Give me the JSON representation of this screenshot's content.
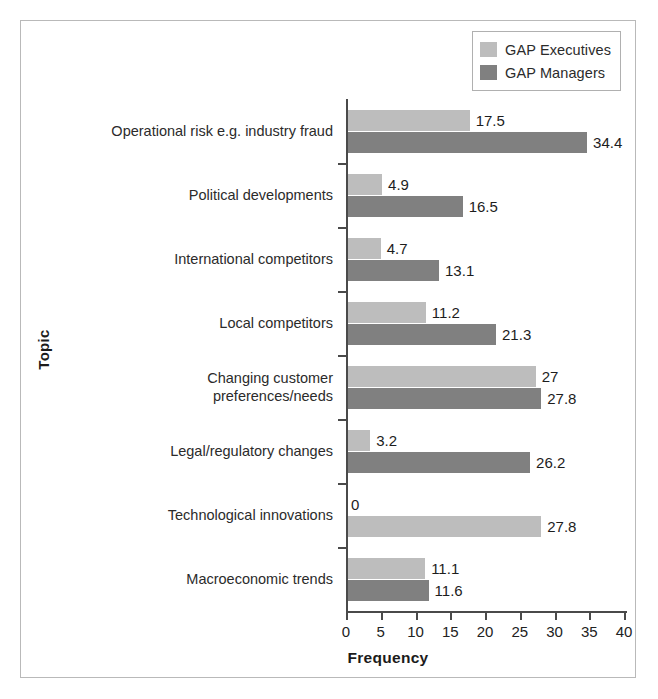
{
  "legend": {
    "position": "top-right",
    "entries": [
      {
        "label": "GAP Executives",
        "color": "#bdbdbd",
        "swatch_name": "legend-swatch-executives"
      },
      {
        "label": "GAP Managers",
        "color": "#808080",
        "swatch_name": "legend-swatch-managers"
      }
    ]
  },
  "axes": {
    "ylabel": "Topic",
    "xlabel": "Frequency",
    "xticks": [
      "0",
      "5",
      "10",
      "15",
      "20",
      "25",
      "30",
      "35",
      "40"
    ]
  },
  "chart_data": {
    "type": "bar",
    "orientation": "horizontal",
    "title": "",
    "xlabel": "Frequency",
    "ylabel": "Topic",
    "xlim": [
      0,
      40
    ],
    "xticks": [
      0,
      5,
      10,
      15,
      20,
      25,
      30,
      35,
      40
    ],
    "grid": false,
    "legend_position": "top-right",
    "categories": [
      "Operational risk e.g. industry fraud",
      "Political developments",
      "International competitors",
      "Local competitors",
      "Changing customer\npreferences/needs",
      "Legal/regulatory changes",
      "Technological innovations",
      "Macroeconomic trends"
    ],
    "series": [
      {
        "name": "GAP Executives",
        "color": "#bdbdbd",
        "values": [
          17.5,
          4.9,
          4.7,
          11.2,
          27,
          3.2,
          0,
          11.1
        ],
        "labels": [
          "17.5",
          "4.9",
          "4.7",
          "11.2",
          "27",
          "3.2",
          "0",
          "11.1"
        ]
      },
      {
        "name": "GAP Managers",
        "color": "#808080",
        "values": [
          34.4,
          16.5,
          13.1,
          21.3,
          27.8,
          26.2,
          27.8,
          11.6
        ],
        "labels": [
          "34.4",
          "16.5",
          "13.1",
          "21.3",
          "27.8",
          "26.2",
          "27.8",
          "11.6"
        ]
      }
    ]
  }
}
